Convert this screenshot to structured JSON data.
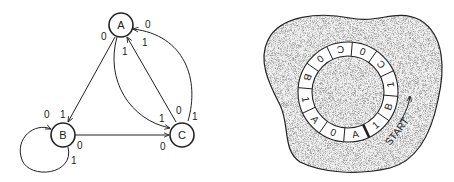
{
  "state_graph": {
    "nodes": [
      {
        "id": "A",
        "label": "A"
      },
      {
        "id": "B",
        "label": "B"
      },
      {
        "id": "C",
        "label": "C"
      }
    ],
    "edges": [
      {
        "from": "A",
        "to": "B",
        "labels": {
          "tail": "0",
          "head": "1"
        }
      },
      {
        "from": "A",
        "to": "C",
        "labels": {
          "tail": "1",
          "head": "1"
        }
      },
      {
        "from": "C",
        "to": "A",
        "labels": {
          "tail": "0",
          "head": "1"
        }
      },
      {
        "from": "C",
        "to": "A",
        "curved": true,
        "labels": {
          "tail": "1",
          "head": "0"
        }
      },
      {
        "from": "B",
        "to": "C",
        "labels": {
          "tail": "0",
          "head": "0"
        }
      },
      {
        "from": "B",
        "to": "B",
        "loop": true,
        "labels": {
          "tail": "1",
          "head": "0"
        }
      }
    ]
  },
  "ring_tape": {
    "segments": [
      "1",
      "B",
      "1",
      "C",
      "0",
      "C",
      "0",
      "B",
      "1",
      "A",
      "0",
      "A"
    ],
    "start_label": "START"
  }
}
